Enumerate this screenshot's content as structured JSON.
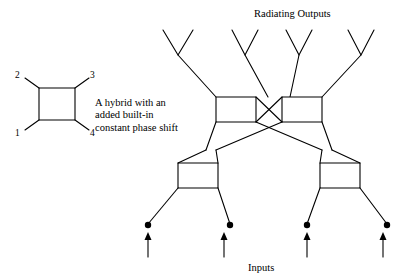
{
  "figure": {
    "title_top": "Radiating Outputs",
    "title_bottom": "Inputs",
    "caption": "A hybrid with an\nadded built-in\nconstant phase shift",
    "port_labels": {
      "p2": "2",
      "p3": "3",
      "p1": "1",
      "p4": "4"
    },
    "colors": {
      "line": "#000000",
      "background": "#ffffff",
      "text": "#000000"
    },
    "legend_symbol": {
      "name": "hybrid-box",
      "description": "square box with four diagonal port stubs"
    },
    "network": {
      "type": "beamforming-feed-network",
      "input_count": 4,
      "output_count": 4,
      "hybrid_count": 4,
      "antenna_count": 4
    }
  }
}
